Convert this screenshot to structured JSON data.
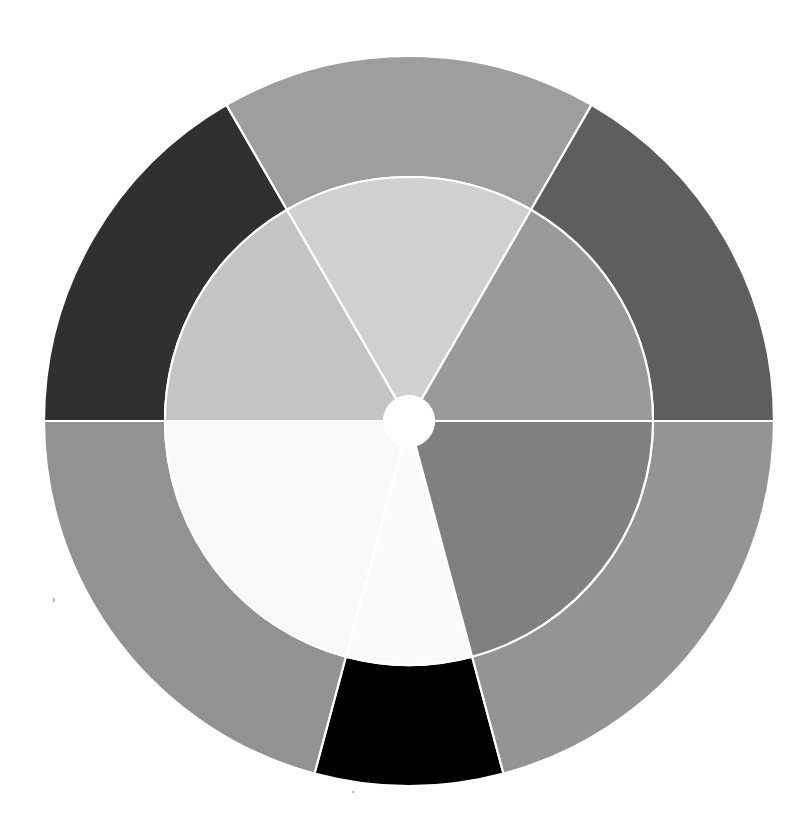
{
  "figure": {
    "title": "",
    "background_color": "#ffffff",
    "width": 808,
    "height": 829
  },
  "geometry": {
    "center_x": 409,
    "center_y": 421,
    "outer_radius": 365,
    "middle_radius": 244,
    "hole_radius": 25,
    "separator_color": "#ffffff",
    "separator_width": 2.2
  },
  "chart_data": {
    "type": "pie",
    "title": "",
    "subtitle": "",
    "xlabel": "",
    "ylabel": "",
    "legend": "none",
    "grid": false,
    "start_angle_deg": 75,
    "direction": "clockwise",
    "rings": [
      {
        "name": "inner",
        "inner_radius": 25,
        "outer_radius": 244,
        "slices": [
          {
            "label": "Inner A",
            "value": 30,
            "percent": 8.3,
            "color": "#fafafa",
            "start_deg": 75,
            "end_deg": 105
          },
          {
            "label": "Inner B",
            "value": 75,
            "percent": 20.8,
            "color": "#f8f8f8",
            "start_deg": 105,
            "end_deg": 180
          },
          {
            "label": "Inner C",
            "value": 60,
            "percent": 16.7,
            "color": "#c4c4c4",
            "start_deg": 180,
            "end_deg": 240
          },
          {
            "label": "Inner D",
            "value": 60,
            "percent": 16.7,
            "color": "#d0d0d0",
            "start_deg": 240,
            "end_deg": 300
          },
          {
            "label": "Inner E",
            "value": 60,
            "percent": 16.7,
            "color": "#9a9a9a",
            "start_deg": 300,
            "end_deg": 360
          },
          {
            "label": "Inner F",
            "value": 75,
            "percent": 20.8,
            "color": "#808080",
            "start_deg": 0,
            "end_deg": 75
          }
        ]
      },
      {
        "name": "outer",
        "inner_radius": 244,
        "outer_radius": 365,
        "slices": [
          {
            "label": "Outer A",
            "value": 30,
            "percent": 8.3,
            "color": "#000000",
            "start_deg": 75,
            "end_deg": 105
          },
          {
            "label": "Outer B",
            "value": 75,
            "percent": 20.8,
            "color": "#929292",
            "start_deg": 105,
            "end_deg": 180
          },
          {
            "label": "Outer C",
            "value": 60,
            "percent": 16.7,
            "color": "#303030",
            "start_deg": 180,
            "end_deg": 240
          },
          {
            "label": "Outer D",
            "value": 60,
            "percent": 16.7,
            "color": "#9e9e9e",
            "start_deg": 240,
            "end_deg": 300
          },
          {
            "label": "Outer E",
            "value": 60,
            "percent": 16.7,
            "color": "#5e5e5e",
            "start_deg": 300,
            "end_deg": 360
          },
          {
            "label": "Outer F",
            "value": 75,
            "percent": 20.8,
            "color": "#949494",
            "start_deg": 0,
            "end_deg": 75
          }
        ]
      }
    ]
  },
  "artifacts": [
    {
      "name": "speck",
      "x": 53,
      "y": 598,
      "w": 2,
      "h": 4
    },
    {
      "name": "speck",
      "x": 352,
      "y": 791,
      "w": 2,
      "h": 2
    }
  ]
}
